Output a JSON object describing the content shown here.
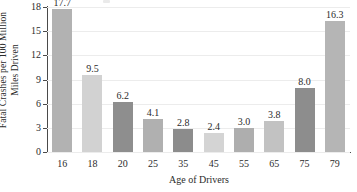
{
  "chart_data": {
    "type": "bar",
    "title": "",
    "xlabel": "Age of Drivers",
    "ylabel": "Fatal Crashes per 100 Million Miles Driven",
    "ylabel_lines": [
      "Fatal Crashes per 100 Million",
      "Miles Driven"
    ],
    "categories": [
      "16",
      "18",
      "20",
      "25",
      "35",
      "45",
      "55",
      "65",
      "75",
      "79"
    ],
    "values": [
      17.7,
      9.5,
      6.2,
      4.1,
      2.8,
      2.4,
      3.0,
      3.8,
      8.0,
      16.3
    ],
    "value_labels": [
      "17.7",
      "9.5",
      "6.2",
      "4.1",
      "2.8",
      "2.4",
      "3.0",
      "3.8",
      "8.0",
      "16.3"
    ],
    "bar_colors": [
      "#b2b2b2",
      "#d2d2d2",
      "#8e8e8e",
      "#b0b0b0",
      "#8c8c8c",
      "#d4d4d4",
      "#aeaeae",
      "#c2c2c2",
      "#8d8d8d",
      "#b5b5b5"
    ],
    "ylim": [
      0,
      18
    ],
    "yticks": [
      0,
      3,
      6,
      9,
      12,
      15,
      18
    ],
    "ytick_labels": [
      "0",
      "3",
      "6",
      "9",
      "12",
      "15",
      "18"
    ],
    "grid": true,
    "grid_color": "#ececec",
    "axis_color": "#4a4a4a",
    "legend": null,
    "legend_position": "none",
    "background": "#ffffff"
  }
}
